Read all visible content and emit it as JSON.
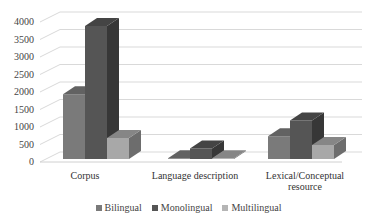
{
  "chart_data": {
    "type": "bar",
    "style": "3d-clustered-column",
    "title": "",
    "xlabel": "",
    "ylabel": "",
    "categories": [
      "Corpus",
      "Language description",
      "Lexical/Conceptual resource"
    ],
    "series": [
      {
        "name": "Bilingual",
        "color": "#7a7a7a",
        "values": [
          1850,
          20,
          650
        ]
      },
      {
        "name": "Monolingual",
        "color": "#555555",
        "values": [
          3800,
          300,
          1100
        ]
      },
      {
        "name": "Multilingual",
        "color": "#a8a8a8",
        "values": [
          600,
          20,
          400
        ]
      }
    ],
    "yticks": [
      "0",
      "500",
      "1000",
      "1500",
      "2000",
      "2500",
      "3000",
      "3500",
      "4000"
    ],
    "ylim": [
      0,
      4000
    ],
    "grid": true,
    "legend_position": "bottom"
  },
  "xlabels": {
    "c0": "Corpus",
    "c1": "Language description",
    "c2a": "Lexical/Conceptual",
    "c2b": "resource"
  },
  "legend": {
    "s0": "Bilingual",
    "s1": "Monolingual",
    "s2": "Multilingual"
  }
}
